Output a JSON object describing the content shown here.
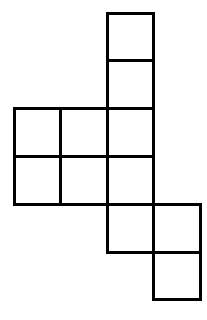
{
  "figure": {
    "type": "grid-net",
    "canvas": {
      "width": 207,
      "height": 320,
      "background_color": "#ffffff"
    },
    "style": {
      "cell_fill_color": "#ffffff",
      "cell_stroke_color": "#000000",
      "stroke_width": 3
    },
    "grid": {
      "origin_x": 14,
      "origin_y": 13,
      "cell_width": 46.5,
      "cell_height": 47.8,
      "columns": 4,
      "rows": 6,
      "column_edges": [
        14,
        60.5,
        107,
        153.5,
        200
      ],
      "row_edges": [
        13,
        60.8,
        108.6,
        156.4,
        204.2,
        252,
        299.8
      ]
    },
    "cells": [
      {
        "id": "cell-c3-r1",
        "col": 3,
        "row": 1
      },
      {
        "id": "cell-c3-r2",
        "col": 3,
        "row": 2
      },
      {
        "id": "cell-c1-r3",
        "col": 1,
        "row": 3
      },
      {
        "id": "cell-c2-r3",
        "col": 2,
        "row": 3
      },
      {
        "id": "cell-c3-r3",
        "col": 3,
        "row": 3
      },
      {
        "id": "cell-c1-r4",
        "col": 1,
        "row": 4
      },
      {
        "id": "cell-c2-r4",
        "col": 2,
        "row": 4
      },
      {
        "id": "cell-c3-r4",
        "col": 3,
        "row": 4
      },
      {
        "id": "cell-c3-r5",
        "col": 3,
        "row": 5
      },
      {
        "id": "cell-c4-r5",
        "col": 4,
        "row": 5
      },
      {
        "id": "cell-c4-r6",
        "col": 4,
        "row": 6
      }
    ],
    "cell_count": 11
  }
}
